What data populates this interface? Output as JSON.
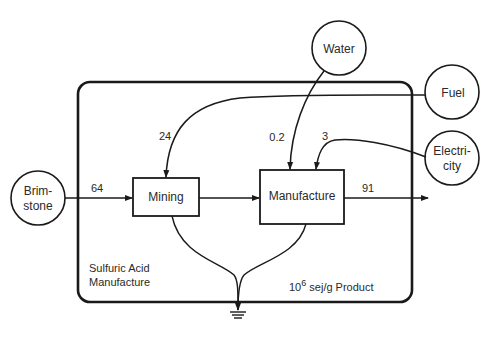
{
  "diagram": {
    "system_label_line1": "Sulfuric Acid",
    "system_label_line2": "Manufacture",
    "units_base": "10",
    "units_exp": "6",
    "units_rest": " sej/g Product",
    "sources": {
      "water": {
        "label": "Water"
      },
      "fuel": {
        "label": "Fuel"
      },
      "electricity": {
        "line1": "Electri-",
        "line2": "city"
      },
      "brimstone": {
        "line1": "Brim-",
        "line2": "stone"
      }
    },
    "processes": {
      "mining": {
        "label": "Mining"
      },
      "manufacture": {
        "label": "Manufacture"
      }
    },
    "flows": {
      "brimstone_to_mining": "64",
      "fuel_to_mining": "24",
      "water_to_manufacture": "0.2",
      "electricity_to_manufacture": "3",
      "product_out": "91"
    },
    "colors": {
      "stroke": "#1a1a1a",
      "text": "#2a2a2a"
    }
  }
}
